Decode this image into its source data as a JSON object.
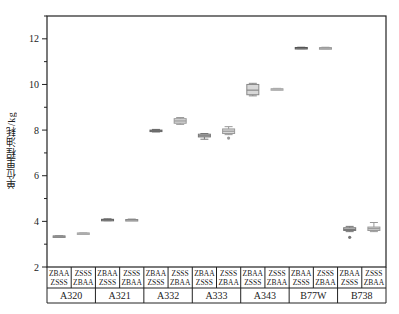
{
  "chart_data": {
    "type": "box",
    "title": "",
    "xlabel": "",
    "ylabel": "单位里程油耗/kg",
    "ylim": [
      2,
      13
    ],
    "yticks": [
      2,
      4,
      6,
      8,
      10,
      12
    ],
    "grid": false,
    "legend": null,
    "categories": [
      "A320",
      "A321",
      "A332",
      "A333",
      "A343",
      "B77W",
      "B738"
    ],
    "routes": [
      [
        "ZBAA",
        "ZSSS"
      ],
      [
        "ZSSS",
        "ZBAA"
      ]
    ],
    "route_labels": [
      "ZBAA-ZSSS",
      "ZSSS-ZBAA"
    ],
    "boxes": [
      {
        "aircraft": "A320",
        "route": "ZBAA-ZSSS",
        "min": 3.33,
        "q1": 3.34,
        "median": 3.35,
        "q3": 3.36,
        "max": 3.37,
        "outliers": [],
        "color": "#888888"
      },
      {
        "aircraft": "A320",
        "route": "ZSSS-ZBAA",
        "min": 3.46,
        "q1": 3.47,
        "median": 3.48,
        "q3": 3.49,
        "max": 3.5,
        "outliers": [],
        "color": "#aaaaaa"
      },
      {
        "aircraft": "A321",
        "route": "ZBAA-ZSSS",
        "min": 4.03,
        "q1": 4.05,
        "median": 4.07,
        "q3": 4.09,
        "max": 4.11,
        "outliers": [],
        "color": "#666666"
      },
      {
        "aircraft": "A321",
        "route": "ZSSS-ZBAA",
        "min": 4.04,
        "q1": 4.06,
        "median": 4.07,
        "q3": 4.08,
        "max": 4.1,
        "outliers": [],
        "color": "#888888"
      },
      {
        "aircraft": "A332",
        "route": "ZBAA-ZSSS",
        "min": 7.92,
        "q1": 7.95,
        "median": 7.97,
        "q3": 8.0,
        "max": 8.03,
        "outliers": [],
        "color": "#666666"
      },
      {
        "aircraft": "A332",
        "route": "ZSSS-ZBAA",
        "min": 8.25,
        "q1": 8.3,
        "median": 8.4,
        "q3": 8.5,
        "max": 8.55,
        "outliers": [],
        "color": "#999999"
      },
      {
        "aircraft": "A333",
        "route": "ZBAA-ZSSS",
        "min": 7.6,
        "q1": 7.7,
        "median": 7.75,
        "q3": 7.82,
        "max": 7.85,
        "outliers": [],
        "color": "#777777"
      },
      {
        "aircraft": "A333",
        "route": "ZSSS-ZBAA",
        "min": 7.8,
        "q1": 7.85,
        "median": 7.95,
        "q3": 8.05,
        "max": 8.15,
        "outliers": [
          7.65
        ],
        "color": "#999999"
      },
      {
        "aircraft": "A343",
        "route": "ZBAA-ZSSS",
        "min": 9.5,
        "q1": 9.55,
        "median": 9.75,
        "q3": 10.0,
        "max": 10.05,
        "outliers": [],
        "color": "#888888"
      },
      {
        "aircraft": "A343",
        "route": "ZSSS-ZBAA",
        "min": 9.77,
        "q1": 9.79,
        "median": 9.8,
        "q3": 9.81,
        "max": 9.83,
        "outliers": [],
        "color": "#aaaaaa"
      },
      {
        "aircraft": "B77W",
        "route": "ZBAA-ZSSS",
        "min": 11.57,
        "q1": 11.58,
        "median": 11.6,
        "q3": 11.62,
        "max": 11.63,
        "outliers": [],
        "color": "#555555"
      },
      {
        "aircraft": "B77W",
        "route": "ZSSS-ZBAA",
        "min": 11.57,
        "q1": 11.59,
        "median": 11.6,
        "q3": 11.61,
        "max": 11.63,
        "outliers": [],
        "color": "#999999"
      },
      {
        "aircraft": "B738",
        "route": "ZBAA-ZSSS",
        "min": 3.55,
        "q1": 3.6,
        "median": 3.65,
        "q3": 3.72,
        "max": 3.78,
        "outliers": [
          3.3
        ],
        "color": "#777777"
      },
      {
        "aircraft": "B738",
        "route": "ZSSS-ZBAA",
        "min": 3.55,
        "q1": 3.6,
        "median": 3.68,
        "q3": 3.75,
        "max": 3.95,
        "outliers": [],
        "color": "#999999"
      }
    ]
  }
}
